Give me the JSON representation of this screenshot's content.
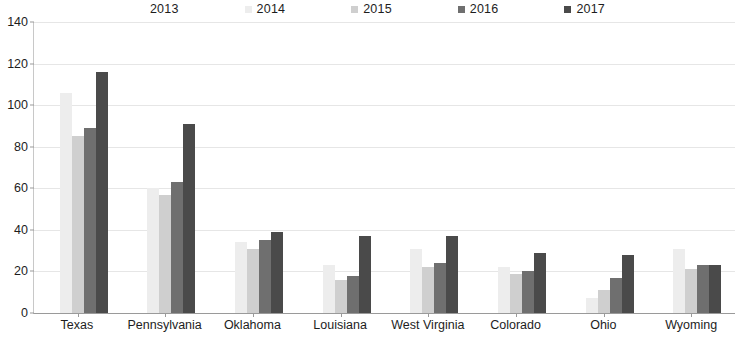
{
  "chart_data": {
    "type": "bar",
    "title": "",
    "subtitle": "",
    "xlabel": "",
    "ylabel": "",
    "ylim": [
      0,
      140
    ],
    "ytick_step": 20,
    "yticks": [
      0,
      20,
      40,
      60,
      80,
      100,
      120,
      140
    ],
    "grid": true,
    "legend_position": "top",
    "categories": [
      "Texas",
      "Pennsylvania",
      "Oklahoma",
      "Louisiana",
      "West Virginia",
      "Colorado",
      "Ohio",
      "Wyoming"
    ],
    "series": [
      {
        "name": "2013",
        "color": "#ffffff",
        "values": [
          0,
          0,
          0,
          0,
          0,
          0,
          0,
          0
        ]
      },
      {
        "name": "2014",
        "color": "#ededed",
        "values": [
          106,
          60,
          34,
          23,
          31,
          22,
          7,
          31
        ]
      },
      {
        "name": "2015",
        "color": "#cfcfcf",
        "values": [
          85,
          57,
          31,
          16,
          22,
          19,
          11,
          21
        ]
      },
      {
        "name": "2016",
        "color": "#6f6f6f",
        "values": [
          89,
          63,
          35,
          18,
          24,
          20,
          17,
          23
        ]
      },
      {
        "name": "2017",
        "color": "#4a4a4a",
        "values": [
          116,
          91,
          39,
          37,
          37,
          29,
          28,
          23
        ]
      }
    ]
  },
  "axis": {
    "y_labels": [
      "140",
      "120",
      "100",
      "80",
      "60",
      "40",
      "20",
      "0"
    ],
    "x_labels": [
      "Texas",
      "Pennsylvania",
      "Oklahoma",
      "Louisiana",
      "West Virginia",
      "Colorado",
      "Ohio",
      "Wyoming"
    ]
  },
  "legend": {
    "items": [
      {
        "label": "2013",
        "color": "#ffffff"
      },
      {
        "label": "2014",
        "color": "#ededed"
      },
      {
        "label": "2015",
        "color": "#cfcfcf"
      },
      {
        "label": "2016",
        "color": "#6f6f6f"
      },
      {
        "label": "2017",
        "color": "#4a4a4a"
      }
    ]
  },
  "colors": {
    "background": "#ffffff",
    "gridline": "#e6e6e6",
    "axis_line": "#9a9a9a",
    "text": "#1d1d1d"
  }
}
